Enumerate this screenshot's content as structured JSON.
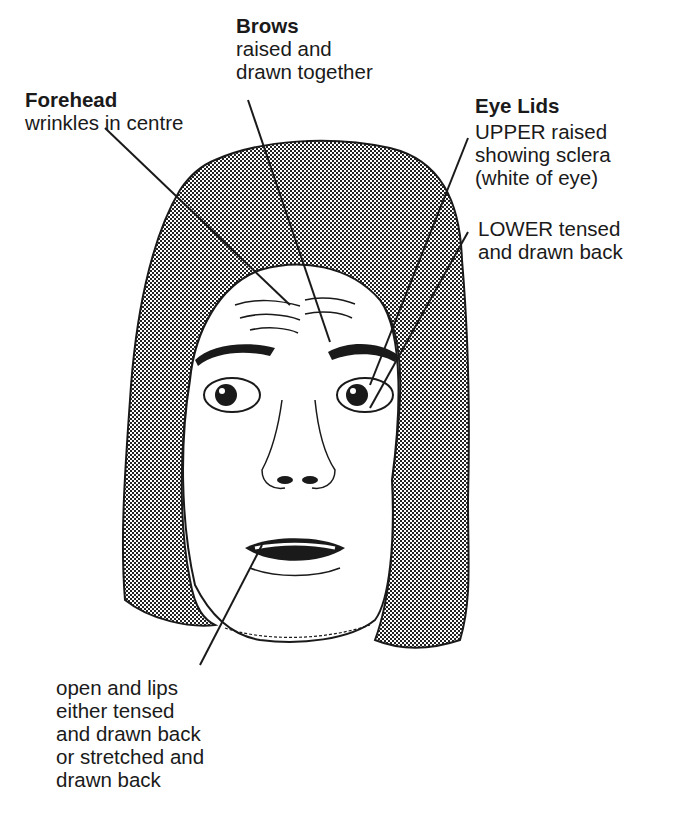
{
  "diagram": {
    "labels": {
      "forehead": {
        "title": "Forehead",
        "lines": [
          "wrinkles in centre"
        ]
      },
      "brows": {
        "title": "Brows",
        "lines": [
          "raised and",
          "drawn together"
        ]
      },
      "eyelids": {
        "title": "Eye Lids",
        "lines": [
          "UPPER raised",
          "showing sclera",
          "(white of eye)"
        ]
      },
      "lower_lid": {
        "lines": [
          "LOWER tensed",
          "and drawn back"
        ]
      },
      "mouth": {
        "lines": [
          "open and lips",
          "either tensed",
          "and drawn back",
          "or stretched and",
          "drawn back"
        ]
      }
    },
    "colors": {
      "ink": "#1a1a1a",
      "hair_fill": "#555555",
      "background": "#ffffff"
    }
  }
}
